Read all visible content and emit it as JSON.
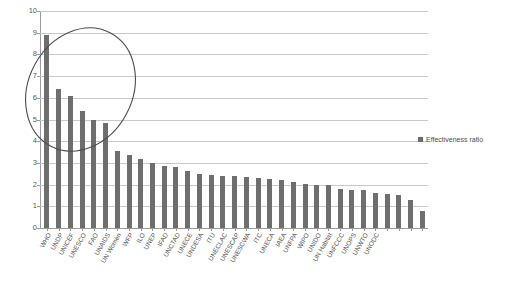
{
  "chart_data": {
    "type": "bar",
    "title": "",
    "xlabel": "",
    "ylabel": "",
    "ylim": [
      0,
      10
    ],
    "ytick_step": 1,
    "grid": true,
    "legend_position": "right",
    "series": [
      {
        "name": "Effectiveness ratio",
        "color": "#6e6e6e",
        "values": [
          8.9,
          6.4,
          6.1,
          5.4,
          5.0,
          4.85,
          3.55,
          3.35,
          3.2,
          3.0,
          2.85,
          2.8,
          2.65,
          2.5,
          2.45,
          2.4,
          2.4,
          2.35,
          2.3,
          2.25,
          2.2,
          2.1,
          2.05,
          2.0,
          2.0,
          1.8,
          1.75,
          1.75,
          1.6,
          1.55,
          1.5,
          1.3,
          0.8
        ]
      }
    ],
    "categories": [
      "WHO",
      "UNDP",
      "UNICEF",
      "UNESCO",
      "FAO",
      "UNAIDS",
      "UN Women",
      "WFP",
      "ILO",
      "UNEP",
      "IFAD",
      "UNCTAD",
      "UNECE",
      "UNDESA",
      "ITU",
      "UNECLAC",
      "UNESCAP",
      "UNESCWA",
      "ITC",
      "UNECA",
      "IAEA",
      "UNFPA",
      "WIPO",
      "UNIDO",
      "UN Habitat",
      "UNFCCC",
      "UNOPS",
      "UNWTO",
      "UNODC",
      "",
      "",
      "",
      ""
    ],
    "ytick_labels": [
      "0",
      "1",
      "2",
      "3",
      "4",
      "5",
      "6",
      "7",
      "8",
      "9",
      "10"
    ],
    "annotations": [
      {
        "type": "ellipse",
        "name": "highlight-ellipse",
        "color": "#4d4d4d",
        "encircles": [
          "WHO",
          "UNDP",
          "UNICEF",
          "UNESCO",
          "FAO",
          "UNAIDS"
        ]
      }
    ]
  },
  "legend": {
    "entries": [
      {
        "label": "Effectiveness ratio",
        "color": "#6e6e6e"
      }
    ]
  }
}
